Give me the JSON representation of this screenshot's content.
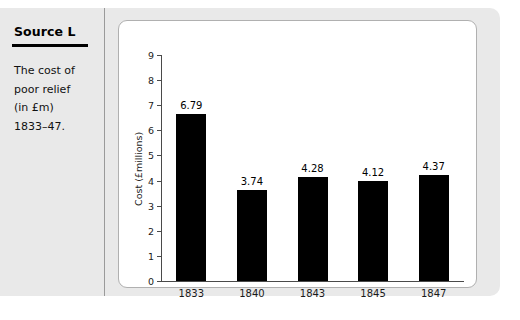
{
  "source": {
    "title": "Source L",
    "caption_lines": [
      "The cost of",
      "poor relief",
      "(in £m)",
      "1833–47."
    ]
  },
  "chart_data": {
    "type": "bar",
    "title": "",
    "subtitle": "",
    "xlabel": "",
    "ylabel": "Cost (£millions)",
    "categories": [
      "1833",
      "1840",
      "1843",
      "1845",
      "1847"
    ],
    "values": [
      6.79,
      3.74,
      4.28,
      4.12,
      4.37
    ],
    "value_labels": [
      "6.79",
      "3.74",
      "4.28",
      "4.12",
      "4.37"
    ],
    "ylim": [
      0,
      9
    ],
    "yticks": [
      0,
      1,
      2,
      3,
      4,
      5,
      6,
      7,
      8,
      9
    ],
    "ytick_labels": [
      "0",
      "1",
      "2",
      "3",
      "4",
      "5",
      "6",
      "7",
      "8",
      "9"
    ],
    "grid": false,
    "legend": false,
    "bar_color": "#000000",
    "axis_color": "#4a4a4a",
    "plot_background": "#ffffff",
    "figure_background": "#e9e9e9"
  }
}
